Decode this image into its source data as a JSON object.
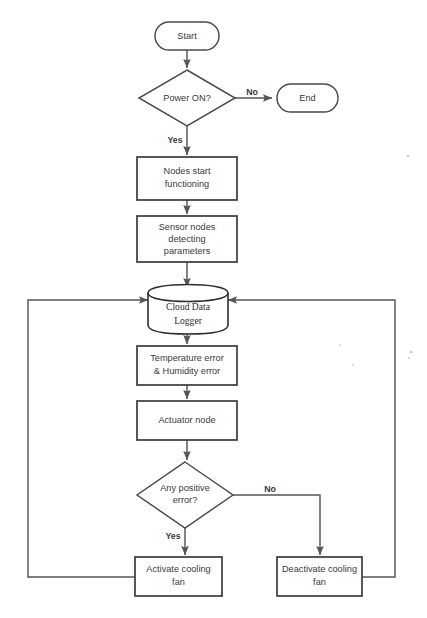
{
  "diagram": {
    "background_color": "#ffffff",
    "line_color": "#555555",
    "text_color": "#3a3a3a",
    "nodes": {
      "start": {
        "label": "Start",
        "shape": "terminator"
      },
      "power_on": {
        "label": "Power ON?",
        "shape": "decision"
      },
      "end": {
        "label": "End",
        "shape": "terminator"
      },
      "nodes_start": {
        "line1": "Nodes start",
        "line2": "functioning",
        "shape": "process"
      },
      "sensor_nodes": {
        "line1": "Sensor nodes",
        "line2": "detecting",
        "line3": "parameters",
        "shape": "process"
      },
      "cloud_logger": {
        "line1": "Cloud Data",
        "line2": "Logger",
        "shape": "database"
      },
      "error_calc": {
        "line1": "Temperature error",
        "line2": "& Humidity error",
        "shape": "process"
      },
      "actuator": {
        "label": "Actuator node",
        "shape": "process"
      },
      "any_positive_error": {
        "line1": "Any positive",
        "line2": "error?",
        "shape": "decision"
      },
      "activate_fan": {
        "line1": "Activate cooling",
        "line2": "fan",
        "shape": "process"
      },
      "deactivate_fan": {
        "line1": "Deactivate cooling",
        "line2": "fan",
        "shape": "process"
      }
    },
    "edge_labels": {
      "power_no": "No",
      "power_yes": "Yes",
      "error_no": "No",
      "error_yes": "Yes"
    }
  }
}
